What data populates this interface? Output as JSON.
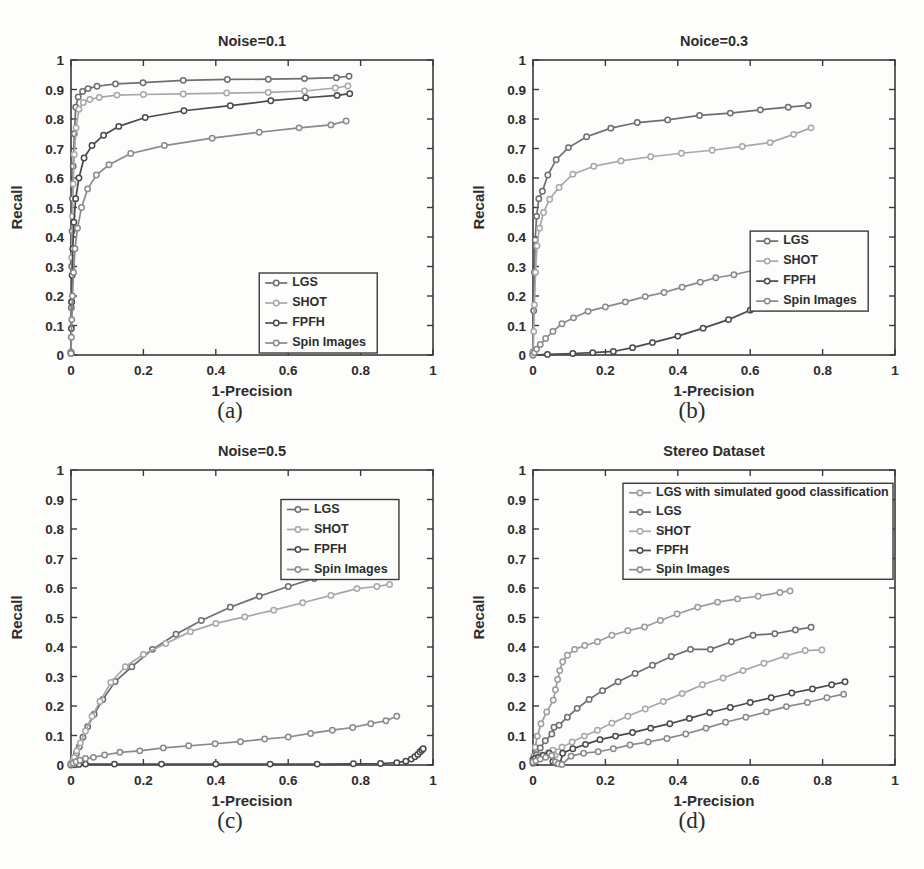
{
  "figure": {
    "background": "#fdfdfb",
    "subplot_labels": [
      {
        "key": "a",
        "text": "(a)"
      },
      {
        "key": "b",
        "text": "(b)"
      },
      {
        "key": "c",
        "text": "(c)"
      },
      {
        "key": "d",
        "text": "(d)"
      }
    ]
  },
  "common": {
    "xlabel": "1-Precision",
    "ylabel": "Recall",
    "xticks": [
      "0",
      "0.2",
      "0.4",
      "0.6",
      "0.8",
      "1"
    ],
    "xtick_values": [
      0,
      0.2,
      0.4,
      0.6,
      0.8,
      1
    ],
    "yticks": [
      "0",
      "0.1",
      "0.2",
      "0.3",
      "0.4",
      "0.5",
      "0.6",
      "0.7",
      "0.8",
      "0.9",
      "1"
    ],
    "ytick_values": [
      0,
      0.1,
      0.2,
      0.3,
      0.4,
      0.5,
      0.6,
      0.7,
      0.8,
      0.9,
      1
    ],
    "xlim": [
      0,
      1
    ],
    "ylim": [
      0,
      1
    ],
    "grid": false
  },
  "colors": {
    "LGS": "#6e6e6e",
    "SHOT": "#a8a8a8",
    "FPFH": "#4a4a4a",
    "Spin Images": "#8a8a8a",
    "LGS with simulated good classification": "#9c9c9c",
    "axis": "#3a3a3a",
    "text": "#2d2d2d"
  },
  "chart_data": [
    {
      "panel": "a",
      "type": "line",
      "title": "Noise=0.1",
      "xlabel": "1-Precision",
      "ylabel": "Recall",
      "xlim": [
        0,
        1
      ],
      "ylim": [
        0,
        1
      ],
      "grid": false,
      "legend_position": "lower-right",
      "series": [
        {
          "name": "LGS",
          "color": "#6e6e6e",
          "x": [
            0.0,
            0.001,
            0.002,
            0.003,
            0.004,
            0.006,
            0.009,
            0.013,
            0.02,
            0.032,
            0.047,
            0.072,
            0.123,
            0.199,
            0.31,
            0.432,
            0.545,
            0.645,
            0.733,
            0.768
          ],
          "y": [
            0.01,
            0.16,
            0.3,
            0.42,
            0.53,
            0.64,
            0.75,
            0.84,
            0.875,
            0.893,
            0.903,
            0.911,
            0.919,
            0.923,
            0.931,
            0.934,
            0.935,
            0.937,
            0.94,
            0.945
          ]
        },
        {
          "name": "SHOT",
          "color": "#a8a8a8",
          "x": [
            0.0,
            0.001,
            0.002,
            0.004,
            0.006,
            0.009,
            0.014,
            0.022,
            0.034,
            0.052,
            0.078,
            0.127,
            0.2,
            0.31,
            0.43,
            0.545,
            0.645,
            0.73,
            0.765
          ],
          "y": [
            0.01,
            0.18,
            0.33,
            0.47,
            0.58,
            0.68,
            0.77,
            0.833,
            0.856,
            0.866,
            0.873,
            0.881,
            0.883,
            0.885,
            0.888,
            0.89,
            0.895,
            0.905,
            0.912
          ]
        },
        {
          "name": "FPFH",
          "color": "#4a4a4a",
          "x": [
            0.0,
            0.001,
            0.002,
            0.003,
            0.005,
            0.008,
            0.013,
            0.022,
            0.036,
            0.058,
            0.09,
            0.132,
            0.205,
            0.312,
            0.44,
            0.552,
            0.648,
            0.735,
            0.77
          ],
          "y": [
            0.005,
            0.09,
            0.18,
            0.27,
            0.36,
            0.45,
            0.53,
            0.6,
            0.668,
            0.71,
            0.745,
            0.775,
            0.805,
            0.828,
            0.845,
            0.862,
            0.872,
            0.88,
            0.886
          ]
        },
        {
          "name": "Spin Images",
          "color": "#8a8a8a",
          "x": [
            0.0,
            0.001,
            0.002,
            0.004,
            0.007,
            0.011,
            0.018,
            0.029,
            0.046,
            0.07,
            0.105,
            0.165,
            0.258,
            0.39,
            0.52,
            0.63,
            0.718,
            0.76
          ],
          "y": [
            0.005,
            0.06,
            0.12,
            0.2,
            0.28,
            0.36,
            0.43,
            0.5,
            0.563,
            0.61,
            0.645,
            0.683,
            0.71,
            0.735,
            0.755,
            0.77,
            0.78,
            0.793
          ]
        }
      ]
    },
    {
      "panel": "b",
      "type": "line",
      "title": "Noice=0.3",
      "xlabel": "1-Precision",
      "ylabel": "Recall",
      "xlim": [
        0,
        1
      ],
      "ylim": [
        0,
        1
      ],
      "grid": false,
      "legend_position": "middle-right",
      "series": [
        {
          "name": "LGS",
          "color": "#6e6e6e",
          "x": [
            0.0,
            0.002,
            0.004,
            0.006,
            0.01,
            0.016,
            0.026,
            0.041,
            0.064,
            0.098,
            0.148,
            0.215,
            0.288,
            0.372,
            0.46,
            0.545,
            0.628,
            0.705,
            0.76
          ],
          "y": [
            0.01,
            0.15,
            0.28,
            0.39,
            0.47,
            0.53,
            0.555,
            0.61,
            0.662,
            0.703,
            0.74,
            0.769,
            0.788,
            0.797,
            0.812,
            0.82,
            0.831,
            0.84,
            0.846
          ]
        },
        {
          "name": "SHOT",
          "color": "#a8a8a8",
          "x": [
            0.0,
            0.002,
            0.004,
            0.007,
            0.011,
            0.018,
            0.029,
            0.046,
            0.072,
            0.11,
            0.168,
            0.243,
            0.325,
            0.41,
            0.495,
            0.578,
            0.655,
            0.72,
            0.768
          ],
          "y": [
            0.008,
            0.08,
            0.17,
            0.28,
            0.37,
            0.43,
            0.483,
            0.528,
            0.568,
            0.613,
            0.64,
            0.658,
            0.672,
            0.684,
            0.694,
            0.707,
            0.72,
            0.748,
            0.77
          ]
        },
        {
          "name": "FPFH",
          "color": "#4a4a4a",
          "x": [
            0.0,
            0.04,
            0.11,
            0.165,
            0.222,
            0.275,
            0.33,
            0.4,
            0.47,
            0.54,
            0.6,
            0.655,
            0.71,
            0.76,
            0.8,
            0.84,
            0.866,
            0.885,
            0.898
          ],
          "y": [
            0.0,
            0.002,
            0.005,
            0.008,
            0.012,
            0.025,
            0.042,
            0.064,
            0.091,
            0.12,
            0.152,
            0.186,
            0.216,
            0.246,
            0.268,
            0.279,
            0.285,
            0.292,
            0.3
          ]
        },
        {
          "name": "Spin Images",
          "color": "#8a8a8a",
          "x": [
            0.0,
            0.004,
            0.01,
            0.02,
            0.035,
            0.055,
            0.08,
            0.112,
            0.152,
            0.2,
            0.255,
            0.31,
            0.362,
            0.412,
            0.462,
            0.505,
            0.555,
            0.612,
            0.672,
            0.74,
            0.8,
            0.845,
            0.872
          ],
          "y": [
            0.0,
            0.008,
            0.02,
            0.036,
            0.056,
            0.08,
            0.106,
            0.126,
            0.148,
            0.163,
            0.18,
            0.198,
            0.212,
            0.23,
            0.247,
            0.262,
            0.272,
            0.288,
            0.3,
            0.32,
            0.333,
            0.358,
            0.382
          ]
        }
      ]
    },
    {
      "panel": "c",
      "type": "line",
      "title": "Noise=0.5",
      "xlabel": "1-Precision",
      "ylabel": "Recall",
      "xlim": [
        0,
        1
      ],
      "ylim": [
        0,
        1
      ],
      "grid": false,
      "legend_position": "upper-right",
      "series": [
        {
          "name": "LGS",
          "color": "#6e6e6e",
          "x": [
            0.0,
            0.004,
            0.009,
            0.015,
            0.023,
            0.033,
            0.046,
            0.064,
            0.088,
            0.122,
            0.168,
            0.225,
            0.29,
            0.36,
            0.44,
            0.52,
            0.6,
            0.672,
            0.745,
            0.8,
            0.83
          ],
          "y": [
            0.004,
            0.01,
            0.02,
            0.038,
            0.062,
            0.094,
            0.13,
            0.172,
            0.222,
            0.283,
            0.333,
            0.392,
            0.443,
            0.49,
            0.535,
            0.572,
            0.605,
            0.632,
            0.645,
            0.652,
            0.657
          ]
        },
        {
          "name": "SHOT",
          "color": "#a8a8a8",
          "x": [
            0.0,
            0.004,
            0.009,
            0.016,
            0.026,
            0.04,
            0.058,
            0.08,
            0.11,
            0.15,
            0.2,
            0.262,
            0.33,
            0.4,
            0.48,
            0.56,
            0.64,
            0.718,
            0.79,
            0.845,
            0.88
          ],
          "y": [
            0.004,
            0.012,
            0.026,
            0.048,
            0.075,
            0.115,
            0.165,
            0.215,
            0.28,
            0.333,
            0.375,
            0.412,
            0.452,
            0.48,
            0.502,
            0.525,
            0.55,
            0.575,
            0.598,
            0.605,
            0.612
          ]
        },
        {
          "name": "FPFH",
          "color": "#4a4a4a",
          "x": [
            0.0,
            0.01,
            0.022,
            0.04,
            0.12,
            0.25,
            0.4,
            0.55,
            0.68,
            0.78,
            0.855,
            0.9,
            0.925,
            0.94,
            0.95,
            0.958,
            0.964,
            0.969,
            0.973
          ],
          "y": [
            0.0,
            0.001,
            0.002,
            0.003,
            0.003,
            0.003,
            0.003,
            0.003,
            0.003,
            0.004,
            0.005,
            0.008,
            0.013,
            0.02,
            0.028,
            0.036,
            0.044,
            0.05,
            0.055
          ]
        },
        {
          "name": "Spin Images",
          "color": "#8a8a8a",
          "x": [
            0.0,
            0.006,
            0.014,
            0.025,
            0.04,
            0.062,
            0.093,
            0.135,
            0.19,
            0.255,
            0.325,
            0.398,
            0.468,
            0.535,
            0.6,
            0.662,
            0.722,
            0.778,
            0.828,
            0.87,
            0.9
          ],
          "y": [
            0.002,
            0.006,
            0.011,
            0.016,
            0.022,
            0.026,
            0.034,
            0.043,
            0.048,
            0.058,
            0.065,
            0.072,
            0.079,
            0.088,
            0.095,
            0.107,
            0.118,
            0.127,
            0.14,
            0.15,
            0.165
          ]
        }
      ]
    },
    {
      "panel": "d",
      "type": "line",
      "title": "Stereo Dataset",
      "xlabel": "1-Precision",
      "ylabel": "Recall",
      "xlim": [
        0,
        1
      ],
      "ylim": [
        0,
        1
      ],
      "grid": false,
      "legend_position": "upper-right-wide",
      "series": [
        {
          "name": "LGS with simulated good classification",
          "color": "#9c9c9c",
          "x": [
            0.0,
            0.002,
            0.006,
            0.012,
            0.022,
            0.038,
            0.056,
            0.062,
            0.068,
            0.074,
            0.082,
            0.095,
            0.115,
            0.143,
            0.178,
            0.218,
            0.262,
            0.308,
            0.352,
            0.398,
            0.455,
            0.51,
            0.565,
            0.622,
            0.682,
            0.71
          ],
          "y": [
            0.01,
            0.03,
            0.06,
            0.098,
            0.14,
            0.18,
            0.22,
            0.255,
            0.29,
            0.32,
            0.35,
            0.372,
            0.392,
            0.405,
            0.418,
            0.44,
            0.455,
            0.468,
            0.49,
            0.512,
            0.535,
            0.552,
            0.563,
            0.572,
            0.585,
            0.59
          ]
        },
        {
          "name": "LGS",
          "color": "#6e6e6e",
          "x": [
            0.0,
            0.004,
            0.01,
            0.02,
            0.034,
            0.052,
            0.058,
            0.072,
            0.095,
            0.122,
            0.155,
            0.192,
            0.235,
            0.282,
            0.33,
            0.382,
            0.435,
            0.49,
            0.548,
            0.608,
            0.668,
            0.725,
            0.768
          ],
          "y": [
            0.006,
            0.018,
            0.035,
            0.058,
            0.082,
            0.105,
            0.128,
            0.135,
            0.162,
            0.192,
            0.222,
            0.252,
            0.282,
            0.31,
            0.338,
            0.368,
            0.392,
            0.392,
            0.418,
            0.44,
            0.445,
            0.458,
            0.467
          ]
        },
        {
          "name": "SHOT",
          "color": "#a8a8a8",
          "x": [
            0.0,
            0.006,
            0.014,
            0.026,
            0.042,
            0.055,
            0.062,
            0.07,
            0.08,
            0.108,
            0.142,
            0.178,
            0.218,
            0.262,
            0.31,
            0.36,
            0.412,
            0.468,
            0.525,
            0.58,
            0.638,
            0.698,
            0.752,
            0.798
          ],
          "y": [
            0.02,
            0.024,
            0.028,
            0.034,
            0.042,
            0.05,
            0.035,
            0.045,
            0.06,
            0.078,
            0.098,
            0.118,
            0.142,
            0.165,
            0.19,
            0.215,
            0.242,
            0.272,
            0.295,
            0.32,
            0.345,
            0.37,
            0.388,
            0.39
          ]
        },
        {
          "name": "FPFH",
          "color": "#4a4a4a",
          "x": [
            0.0,
            0.006,
            0.015,
            0.028,
            0.045,
            0.055,
            0.065,
            0.075,
            0.082,
            0.11,
            0.145,
            0.185,
            0.228,
            0.275,
            0.325,
            0.378,
            0.432,
            0.488,
            0.545,
            0.6,
            0.658,
            0.715,
            0.772,
            0.825,
            0.862
          ],
          "y": [
            0.018,
            0.022,
            0.026,
            0.032,
            0.04,
            0.012,
            0.006,
            0.004,
            0.04,
            0.055,
            0.07,
            0.086,
            0.098,
            0.11,
            0.125,
            0.14,
            0.158,
            0.178,
            0.195,
            0.212,
            0.228,
            0.244,
            0.258,
            0.272,
            0.282
          ]
        },
        {
          "name": "Spin Images",
          "color": "#8a8a8a",
          "x": [
            0.0,
            0.008,
            0.02,
            0.035,
            0.052,
            0.062,
            0.07,
            0.08,
            0.105,
            0.14,
            0.18,
            0.222,
            0.268,
            0.318,
            0.37,
            0.422,
            0.478,
            0.532,
            0.588,
            0.645,
            0.7,
            0.758,
            0.812,
            0.858
          ],
          "y": [
            0.01,
            0.014,
            0.02,
            0.026,
            0.032,
            0.01,
            0.004,
            0.002,
            0.03,
            0.04,
            0.045,
            0.055,
            0.068,
            0.078,
            0.09,
            0.105,
            0.125,
            0.145,
            0.162,
            0.18,
            0.198,
            0.212,
            0.228,
            0.24
          ]
        }
      ]
    }
  ]
}
